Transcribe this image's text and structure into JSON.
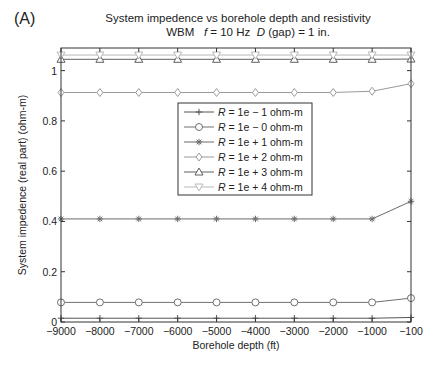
{
  "panel_label": "(A)",
  "chart_data": {
    "type": "line",
    "title": "System impedence vs borehole depth and resistivity",
    "subtitle": {
      "prefix": "WBM",
      "f_symbol": "f",
      "f_text": " = 10 Hz",
      "d_symbol": "D",
      "d_text": " (gap) = 1 in."
    },
    "xlabel": "Borehole depth (ft)",
    "ylabel": "System impedence (real part) (ohm-m)",
    "x": [
      -9000,
      -8000,
      -7000,
      -6000,
      -5000,
      -4000,
      -3000,
      -2000,
      -1000,
      -100
    ],
    "x_tick_labels": [
      "−9000",
      "−8000",
      "−7000",
      "−6000",
      "−5000",
      "−4000",
      "−3000",
      "−2000",
      "−1000",
      "−100"
    ],
    "y_ticks": [
      0,
      0.2,
      0.4,
      0.6,
      0.8,
      1
    ],
    "y_tick_labels": [
      "0",
      "0.2",
      "0.4",
      "0.6",
      "0.8",
      "1"
    ],
    "ylim": [
      0,
      1.09
    ],
    "grid": false,
    "legend_position": "center",
    "series": [
      {
        "name": "R = 1e − 1 ohm-m",
        "r_symbol": "R",
        "label_text": " = 1e − 1 ohm-m",
        "marker": "plus",
        "color": "#555555",
        "values": [
          0.015,
          0.015,
          0.015,
          0.015,
          0.015,
          0.015,
          0.015,
          0.015,
          0.015,
          0.018
        ]
      },
      {
        "name": "R = 1e − 0 ohm-m",
        "r_symbol": "R",
        "label_text": " = 1e − 0 ohm-m",
        "marker": "circle",
        "color": "#707070",
        "values": [
          0.078,
          0.078,
          0.078,
          0.078,
          0.078,
          0.078,
          0.078,
          0.078,
          0.078,
          0.095
        ]
      },
      {
        "name": "R = 1e + 1 ohm-m",
        "r_symbol": "R",
        "label_text": " = 1e + 1 ohm-m",
        "marker": "asterisk",
        "color": "#6a6a6a",
        "values": [
          0.41,
          0.41,
          0.41,
          0.41,
          0.41,
          0.41,
          0.41,
          0.41,
          0.41,
          0.48
        ]
      },
      {
        "name": "R = 1e + 2 ohm-m",
        "r_symbol": "R",
        "label_text": " = 1e + 2 ohm-m",
        "marker": "diamond",
        "color": "#9a9a9a",
        "values": [
          0.913,
          0.913,
          0.913,
          0.913,
          0.913,
          0.913,
          0.913,
          0.913,
          0.918,
          0.948
        ]
      },
      {
        "name": "R = 1e + 3 ohm-m",
        "r_symbol": "R",
        "label_text": " = 1e + 3 ohm-m",
        "marker": "triangle-up",
        "color": "#606060",
        "values": [
          1.045,
          1.045,
          1.045,
          1.045,
          1.045,
          1.045,
          1.045,
          1.045,
          1.045,
          1.046
        ]
      },
      {
        "name": "R = 1e + 4 ohm-m",
        "r_symbol": "R",
        "label_text": " = 1e + 4 ohm-m",
        "marker": "triangle-down",
        "color": "#b8b8b8",
        "values": [
          1.062,
          1.062,
          1.062,
          1.062,
          1.062,
          1.062,
          1.062,
          1.062,
          1.062,
          1.062
        ]
      }
    ]
  }
}
